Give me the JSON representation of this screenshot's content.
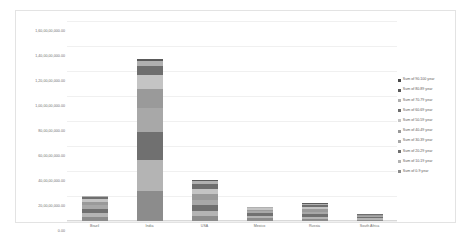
{
  "chart_data": {
    "type": "bar",
    "stacked": true,
    "title": "",
    "xlabel": "",
    "ylabel": "",
    "grid": true,
    "legend_position": "right",
    "categories": [
      "Brazil",
      "India",
      "USA",
      "Mexico",
      "Russia",
      "South Africa"
    ],
    "ylim": [
      0,
      1600000000
    ],
    "ytick_labels": [
      "1,60,00,00,000.00",
      "1,40,00,00,000.00",
      "1,20,00,00,000.00",
      "1,00,00,00,000.00",
      "80,00,00,000.00",
      "60,00,00,000.00",
      "40,00,00,000.00",
      "20,00,00,000.00",
      "0.00"
    ],
    "ytick_values": [
      1600000000,
      1400000000,
      1200000000,
      1000000000,
      800000000,
      600000000,
      400000000,
      200000000,
      0
    ],
    "series": [
      {
        "name": "Sum of 0-9 year",
        "color": "#8c8c8c",
        "values": [
          30000000,
          240000000,
          41000000,
          21000000,
          19000000,
          11000000
        ]
      },
      {
        "name": "Sum of 10-19 year",
        "color": "#b4b4b4",
        "values": [
          32000000,
          245000000,
          42000000,
          21000000,
          15000000,
          10000000
        ]
      },
      {
        "name": "Sum of 20-29 year",
        "color": "#707070",
        "values": [
          33000000,
          230000000,
          45000000,
          20000000,
          19000000,
          10000000
        ]
      },
      {
        "name": "Sum of 30-39 year",
        "color": "#a8a8a8",
        "values": [
          31000000,
          190000000,
          43000000,
          17000000,
          22000000,
          9000000
        ]
      },
      {
        "name": "Sum of 40-49 year",
        "color": "#9a9a9a",
        "values": [
          27000000,
          150000000,
          42000000,
          13000000,
          20000000,
          7000000
        ]
      },
      {
        "name": "Sum of 50-59 year",
        "color": "#c4c4c4",
        "values": [
          22000000,
          110000000,
          43000000,
          9000000,
          19000000,
          5000000
        ]
      },
      {
        "name": "Sum of 60-69 year",
        "color": "#6e6e6e",
        "values": [
          15000000,
          75000000,
          37000000,
          6000000,
          16000000,
          3000000
        ]
      },
      {
        "name": "Sum of 70-79 year",
        "color": "#b0b0b0",
        "values": [
          8000000,
          40000000,
          24000000,
          3000000,
          9000000,
          1500000
        ]
      },
      {
        "name": "Sum of 80-89 year",
        "color": "#5a5a5a",
        "values": [
          3000000,
          15000000,
          12000000,
          1200000,
          4000000,
          600000
        ]
      },
      {
        "name": "Sum of 90-100 year",
        "color": "#4a4a4a",
        "values": [
          600000,
          3000000,
          2500000,
          250000,
          700000,
          120000
        ]
      }
    ]
  },
  "legend": {
    "items": [
      {
        "label": "Sum of 90-100 year",
        "color": "#4a4a4a"
      },
      {
        "label": "Sum of 80-89 year",
        "color": "#5a5a5a"
      },
      {
        "label": "Sum of 70-79 year",
        "color": "#b0b0b0"
      },
      {
        "label": "Sum of 60-69 year",
        "color": "#6e6e6e"
      },
      {
        "label": "Sum of 50-59 year",
        "color": "#c4c4c4"
      },
      {
        "label": "Sum of 40-49 year",
        "color": "#9a9a9a"
      },
      {
        "label": "Sum of 30-39 year",
        "color": "#a8a8a8"
      },
      {
        "label": "Sum of 20-29 year",
        "color": "#707070"
      },
      {
        "label": "Sum of 10-19 year",
        "color": "#b4b4b4"
      },
      {
        "label": "Sum of 0-9 year",
        "color": "#8c8c8c"
      }
    ]
  },
  "colors": {
    "chart_border": "#e3e3e3",
    "gridline": "#f0f0f0",
    "axis_line": "#d9d9d9",
    "tick_text": "#6e6e6e",
    "legend_text": "#5a5a5a",
    "background": "#ffffff"
  }
}
